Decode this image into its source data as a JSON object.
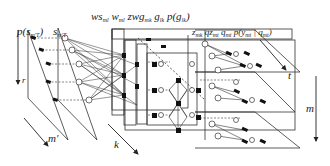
{
  "labels": {
    "p_s": "p(s",
    "p_s_sub": "m'T",
    "p_s_close": ")",
    "s": "s",
    "s_sub": "m'T",
    "top_group": {
      "ws": "ws",
      "ws_sub": "ml",
      "w": "w",
      "w_sub": "ml",
      "zwg": "zwg",
      "zwg_sub": "mk",
      "g": "g",
      "g_sub": "lk",
      "pg": "p(g",
      "pg_sub": "lk",
      "pg_close": ")"
    },
    "right_group": {
      "z": "z",
      "z_sub": "mk",
      "qz": "qz",
      "qz_sub": "mt",
      "q": "q",
      "q_sub": "mt",
      "py": "p(y",
      "py_sub": "mt",
      "py_mid": " | q",
      "py_sub2": "mt",
      "py_close": ")"
    },
    "axis_r": "r",
    "axis_m_prime": "m'",
    "axis_k": "k",
    "axis_t": "t",
    "axis_m": "m"
  },
  "colors": {
    "line": "#333333",
    "node_fill": "#111111",
    "node_open": "#ffffff",
    "background": "#ffffff"
  }
}
